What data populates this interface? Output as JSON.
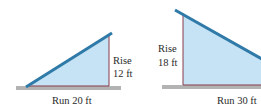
{
  "diagram": {
    "colors": {
      "fill": "#c5e3f4",
      "slope": "#2f7aa8",
      "edge": "#8a3a4a",
      "ground": "#b3b3b3",
      "text": "#2a2a2a"
    },
    "left_triangle": {
      "rise_label": "Rise",
      "rise_value": "12 ft",
      "run_label": "Run 20 ft"
    },
    "right_triangle": {
      "rise_label": "Rise",
      "rise_value": "18 ft",
      "run_label": "Run 30 ft"
    }
  }
}
